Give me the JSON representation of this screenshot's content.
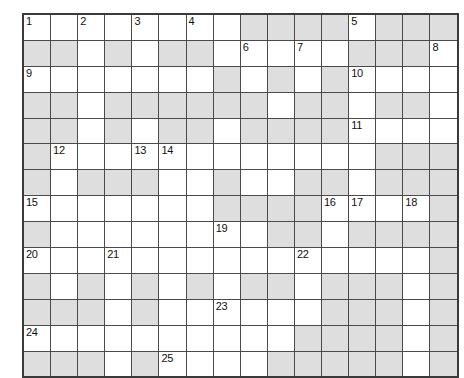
{
  "puzzle": {
    "type": "crossword-grid",
    "title": "",
    "columns": 16,
    "rows": 14,
    "colors": {
      "cell_white": "#ffffff",
      "cell_shaded": "#dedede",
      "grid_line": "#4a4a4a",
      "grid_border": "#3a3a3a",
      "number_text": "#111111",
      "page_background": "#ffffff"
    },
    "clue_numbers_present": [
      1,
      2,
      3,
      4,
      5,
      6,
      7,
      8,
      9,
      10,
      11,
      12,
      13,
      14,
      15,
      16,
      17,
      18,
      19,
      20,
      21,
      22,
      23,
      24,
      25
    ],
    "numbered_cells": [
      {
        "number": "1",
        "row": 1,
        "col": 1
      },
      {
        "number": "2",
        "row": 1,
        "col": 3
      },
      {
        "number": "3",
        "row": 1,
        "col": 5
      },
      {
        "number": "4",
        "row": 1,
        "col": 7
      },
      {
        "number": "5",
        "row": 1,
        "col": 13
      },
      {
        "number": "6",
        "row": 2,
        "col": 9
      },
      {
        "number": "7",
        "row": 2,
        "col": 11
      },
      {
        "number": "8",
        "row": 2,
        "col": 16
      },
      {
        "number": "9",
        "row": 3,
        "col": 1
      },
      {
        "number": "10",
        "row": 3,
        "col": 13
      },
      {
        "number": "11",
        "row": 5,
        "col": 13
      },
      {
        "number": "12",
        "row": 6,
        "col": 2
      },
      {
        "number": "13",
        "row": 6,
        "col": 5
      },
      {
        "number": "14",
        "row": 6,
        "col": 6
      },
      {
        "number": "15",
        "row": 8,
        "col": 1
      },
      {
        "number": "16",
        "row": 8,
        "col": 12
      },
      {
        "number": "17",
        "row": 8,
        "col": 13
      },
      {
        "number": "18",
        "row": 8,
        "col": 15
      },
      {
        "number": "19",
        "row": 9,
        "col": 8
      },
      {
        "number": "20",
        "row": 10,
        "col": 1
      },
      {
        "number": "21",
        "row": 10,
        "col": 4
      },
      {
        "number": "22",
        "row": 10,
        "col": 11
      },
      {
        "number": "23",
        "row": 12,
        "col": 8
      },
      {
        "number": "24",
        "row": 13,
        "col": 1
      },
      {
        "number": "25",
        "row": 14,
        "col": 6
      }
    ],
    "grid": [
      [
        "w",
        "w",
        "w",
        "w",
        "w",
        "w",
        "w",
        "w",
        "s",
        "s",
        "s",
        "s",
        "w",
        "s",
        "s",
        "s"
      ],
      [
        "s",
        "s",
        "w",
        "s",
        "w",
        "s",
        "s",
        "w",
        "w",
        "w",
        "w",
        "w",
        "s",
        "s",
        "s",
        "w"
      ],
      [
        "w",
        "w",
        "w",
        "w",
        "w",
        "w",
        "w",
        "s",
        "w",
        "s",
        "w",
        "s",
        "w",
        "w",
        "w",
        "w"
      ],
      [
        "s",
        "s",
        "w",
        "s",
        "s",
        "s",
        "s",
        "s",
        "s",
        "w",
        "s",
        "s",
        "w",
        "s",
        "s",
        "w"
      ],
      [
        "s",
        "s",
        "w",
        "s",
        "w",
        "s",
        "s",
        "w",
        "s",
        "s",
        "s",
        "s",
        "w",
        "w",
        "w",
        "w"
      ],
      [
        "s",
        "w",
        "w",
        "w",
        "w",
        "w",
        "w",
        "w",
        "w",
        "w",
        "w",
        "w",
        "w",
        "s",
        "s",
        "s"
      ],
      [
        "s",
        "w",
        "s",
        "s",
        "s",
        "w",
        "w",
        "s",
        "w",
        "w",
        "s",
        "s",
        "w",
        "s",
        "s",
        "s"
      ],
      [
        "w",
        "w",
        "w",
        "w",
        "w",
        "w",
        "w",
        "s",
        "s",
        "s",
        "s",
        "w",
        "w",
        "w",
        "w",
        "s"
      ],
      [
        "s",
        "w",
        "w",
        "w",
        "w",
        "w",
        "w",
        "w",
        "w",
        "s",
        "s",
        "w",
        "s",
        "s",
        "s",
        "s"
      ],
      [
        "w",
        "w",
        "w",
        "w",
        "w",
        "w",
        "w",
        "w",
        "w",
        "w",
        "w",
        "w",
        "w",
        "w",
        "w",
        "s"
      ],
      [
        "s",
        "w",
        "s",
        "w",
        "s",
        "w",
        "s",
        "w",
        "s",
        "s",
        "w",
        "s",
        "s",
        "s",
        "w",
        "s"
      ],
      [
        "s",
        "s",
        "s",
        "w",
        "s",
        "w",
        "w",
        "w",
        "w",
        "w",
        "w",
        "s",
        "s",
        "s",
        "w",
        "s"
      ],
      [
        "w",
        "w",
        "w",
        "w",
        "w",
        "w",
        "w",
        "w",
        "w",
        "w",
        "s",
        "s",
        "s",
        "s",
        "w",
        "s"
      ],
      [
        "s",
        "s",
        "s",
        "w",
        "s",
        "w",
        "w",
        "w",
        "w",
        "s",
        "s",
        "s",
        "s",
        "s",
        "w",
        "s"
      ]
    ]
  }
}
